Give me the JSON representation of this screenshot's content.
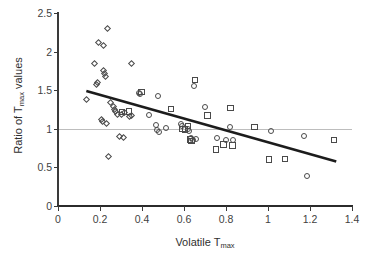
{
  "chart_data": {
    "type": "scatter",
    "title": "",
    "xlabel": "Volatile Tmax",
    "ylabel": "Ratio of Tmax values",
    "xlabel_base": "Volatile T",
    "xlabel_sub": "max",
    "ylabel_part1": "Ratio  of  T",
    "ylabel_sub": "max",
    "ylabel_part2": " values",
    "xlim": [
      0,
      1.4
    ],
    "ylim": [
      0,
      2.5
    ],
    "xticks": [
      0,
      0.2,
      0.4,
      0.6,
      0.8,
      1,
      1.2,
      1.4
    ],
    "xtick_labels": [
      "0",
      "0.2",
      "0.4",
      "0.6",
      "0.8",
      "1",
      "1.2",
      "1.4"
    ],
    "yticks": [
      0,
      0.5,
      1,
      1.5,
      2,
      2.5
    ],
    "ytick_labels": [
      "0",
      "0.5",
      "1",
      "1.5",
      "2",
      "2.5"
    ],
    "grid": false,
    "legend": "none",
    "reference_line": {
      "name": "unity-line",
      "orientation": "horizontal",
      "y": 1,
      "color": "#bdbdbd",
      "width": 1
    },
    "trend_line": {
      "name": "regression-trendline",
      "x_start": 0.135,
      "y_start": 1.49,
      "x_end": 1.325,
      "y_end": 0.575,
      "color": "#1c1c1c",
      "width": 2.6
    },
    "series": [
      {
        "name": "diamond-series",
        "marker": "diamond",
        "color": "#4a4a4a",
        "points": [
          [
            0.135,
            1.385
          ],
          [
            0.175,
            1.84
          ],
          [
            0.185,
            1.575
          ],
          [
            0.19,
            1.6
          ],
          [
            0.195,
            2.12
          ],
          [
            0.205,
            1.12
          ],
          [
            0.21,
            1.1
          ],
          [
            0.215,
            2.08
          ],
          [
            0.218,
            1.755
          ],
          [
            0.222,
            1.71
          ],
          [
            0.228,
            1.68
          ],
          [
            0.232,
            1.075
          ],
          [
            0.238,
            2.3
          ],
          [
            0.24,
            0.64
          ],
          [
            0.252,
            1.345
          ],
          [
            0.265,
            1.285
          ],
          [
            0.268,
            1.255
          ],
          [
            0.272,
            1.22
          ],
          [
            0.285,
            1.185
          ],
          [
            0.295,
            0.895
          ],
          [
            0.3,
            1.185
          ],
          [
            0.312,
            0.89
          ],
          [
            0.318,
            1.215
          ],
          [
            0.342,
            1.155
          ],
          [
            0.348,
            1.175
          ],
          [
            0.352,
            1.84
          ]
        ]
      },
      {
        "name": "circle-series",
        "marker": "circle",
        "color": "#4a4a4a",
        "points": [
          [
            0.385,
            1.47
          ],
          [
            0.392,
            1.455
          ],
          [
            0.432,
            1.185
          ],
          [
            0.468,
            1.055
          ],
          [
            0.472,
            0.985
          ],
          [
            0.478,
            1.425
          ],
          [
            0.482,
            0.955
          ],
          [
            0.512,
            1.01
          ],
          [
            0.585,
            1.065
          ],
          [
            0.592,
            1.035
          ],
          [
            0.618,
            1.0
          ],
          [
            0.622,
            0.975
          ],
          [
            0.632,
            0.885
          ],
          [
            0.645,
            0.86
          ],
          [
            0.648,
            1.55
          ],
          [
            0.655,
            0.865
          ],
          [
            0.702,
            1.285
          ],
          [
            0.758,
            0.875
          ],
          [
            0.798,
            0.855
          ],
          [
            0.818,
            1.02
          ],
          [
            0.832,
            0.85
          ],
          [
            1.015,
            0.975
          ],
          [
            1.172,
            0.905
          ],
          [
            1.188,
            0.395
          ]
        ]
      },
      {
        "name": "square-series",
        "marker": "square",
        "color": "#4a4a4a",
        "points": [
          [
            0.305,
            1.22
          ],
          [
            0.338,
            1.225
          ],
          [
            0.398,
            1.475
          ],
          [
            0.538,
            1.255
          ],
          [
            0.592,
            1.0
          ],
          [
            0.605,
            0.99
          ],
          [
            0.618,
            1.035
          ],
          [
            0.628,
            0.86
          ],
          [
            0.635,
            0.845
          ],
          [
            0.652,
            1.635
          ],
          [
            0.712,
            1.175
          ],
          [
            0.752,
            0.73
          ],
          [
            0.788,
            0.795
          ],
          [
            0.822,
            1.27
          ],
          [
            0.832,
            0.785
          ],
          [
            0.935,
            1.025
          ],
          [
            1.005,
            0.605
          ],
          [
            1.082,
            0.61
          ],
          [
            1.315,
            0.855
          ]
        ]
      }
    ]
  }
}
